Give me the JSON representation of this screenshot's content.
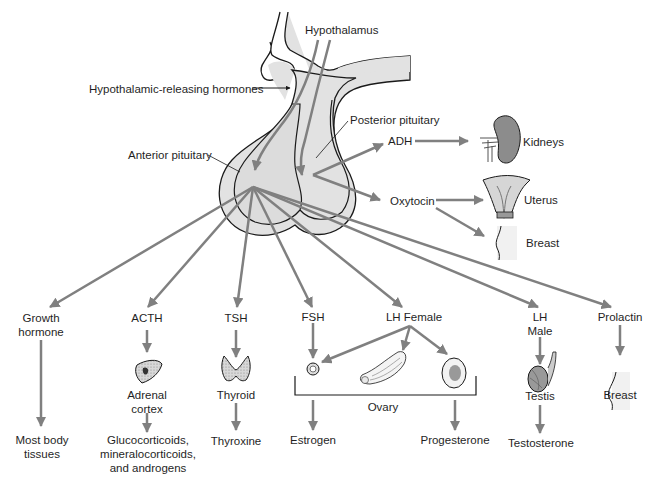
{
  "diagram": {
    "colors": {
      "arrow": "#808080",
      "gland_fill": "#e2e2e2",
      "gland_stroke": "#1a1a1a",
      "kidney_fill": "#8c8c8c",
      "text": "#1f1f1f"
    },
    "structures": {
      "hypothalamus": "Hypothalamus",
      "releasing_hormones": "Hypothalamic-releasing hormones",
      "anterior_pituitary": "Anterior pituitary",
      "posterior_pituitary": "Posterior pituitary"
    },
    "posterior_hormones": [
      {
        "hormone": "ADH",
        "targets": [
          "Kidneys"
        ]
      },
      {
        "hormone": "Oxytocin",
        "targets": [
          "Uterus",
          "Breast"
        ]
      }
    ],
    "anterior_hormones": [
      {
        "hormone_line1": "Growth",
        "hormone_line2": "hormone",
        "organ": "",
        "product": [
          "Most body",
          "tissues"
        ]
      },
      {
        "hormone_line1": "ACTH",
        "organ_line1": "Adrenal",
        "organ_line2": "cortex",
        "product": [
          "Glucocorticoids,",
          "mineralocorticoids,",
          "and androgens"
        ]
      },
      {
        "hormone_line1": "TSH",
        "organ_line1": "Thyroid",
        "product": [
          "Thyroxine"
        ]
      },
      {
        "hormone_line1": "FSH",
        "product": [
          "Estrogen"
        ]
      },
      {
        "hormone_line1": "LH Female",
        "organ_line1": "Ovary",
        "product": [
          "Progesterone"
        ]
      },
      {
        "hormone_line1": "LH",
        "hormone_line2": "Male",
        "organ_line1": "Testis",
        "product": [
          "Testosterone"
        ]
      },
      {
        "hormone_line1": "Prolactin",
        "organ_line1": "Breast",
        "product": []
      }
    ]
  }
}
